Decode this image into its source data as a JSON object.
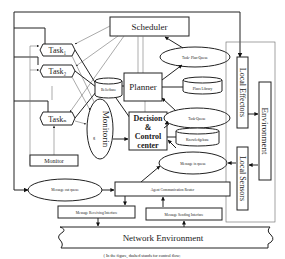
{
  "diagram": {
    "nodes": {
      "scheduler": "Scheduler",
      "task1": "Task₁",
      "task2": "Task₂",
      "taskn": "Taskₙ",
      "ellipsis": "¦",
      "beliefbase": "Beliefbase",
      "planner": "Planner",
      "decision_line1": "Decision",
      "decision_line2": "&",
      "decision_line3": "Control",
      "decision_line4": "center",
      "monitoring": "Monitorin",
      "monitoring_suffix": "g",
      "monitor": "Monitor",
      "task_plan_queue": "Task- Plan-Queue",
      "plans_library": "Plans Library",
      "task_queue": "Task-Queue",
      "knowledgebase": "Knowledgebase",
      "message_in_queue": "Message in queue",
      "local_effectors": "Local Effectors",
      "environment": "Environment",
      "local_sensors": "Local Sensors",
      "message_out_queue": "Message out queue",
      "agent_router": "Agent Communication Router",
      "msg_receiving": "Message Receiving Interface",
      "msg_sending": "Message Sending  Interface",
      "network": "Network Environment"
    },
    "caption": "( In the figure, dashed stands for control flow;",
    "colors": {
      "stroke": "#222222",
      "background": "#ffffff",
      "dashed": "#777777"
    }
  }
}
